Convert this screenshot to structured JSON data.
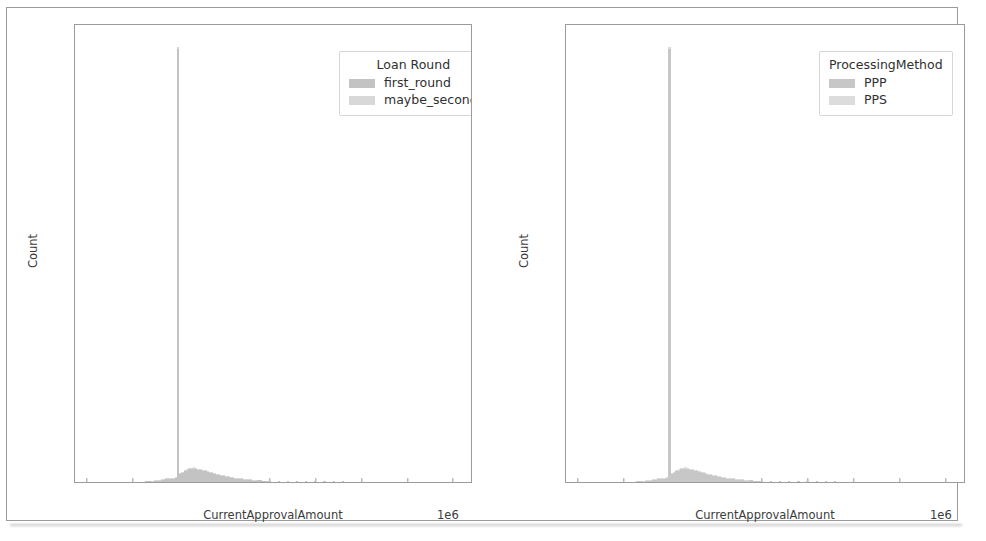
{
  "figure": {
    "background": "#ffffff",
    "frame_color": "#9a9a9a"
  },
  "chart_data": [
    {
      "type": "bar",
      "title": "",
      "subtitle": "",
      "xlabel": "CurrentApprovalAmount",
      "ylabel": "Count",
      "x_offset_text": "1e6",
      "xlim": [
        -250000,
        8400000
      ],
      "ylim": [
        0,
        1530
      ],
      "xticks": [
        0,
        1,
        2,
        3,
        4,
        5,
        6,
        7,
        8
      ],
      "xtick_labels": [
        "0",
        "1",
        "2",
        "3",
        "4",
        "5",
        "6",
        "7",
        "8"
      ],
      "yticks": [
        0,
        200,
        400,
        600,
        800,
        1000,
        1200,
        1400
      ],
      "ytick_labels": [
        "0",
        "200",
        "400",
        "600",
        "800",
        "1000",
        "1200",
        "1400"
      ],
      "grid": false,
      "legend": {
        "title": "Loan Round",
        "position": "upper right",
        "entries": [
          {
            "name": "first_round",
            "color": "#c3c3c3"
          },
          {
            "name": "maybe_second",
            "color": "#d8d8d8"
          }
        ]
      },
      "note": "Stacked histogram of CurrentApprovalAmount (USD, x1e6). Dominant single-bin spike at 2e6.",
      "bin_width_m": 0.05,
      "series": [
        {
          "name": "first_round",
          "color": "#c3c3c3",
          "bins_m": [
            1.3,
            1.35,
            1.4,
            1.45,
            1.5,
            1.55,
            1.6,
            1.65,
            1.7,
            1.75,
            1.8,
            1.85,
            1.9,
            1.95,
            2.0,
            2.05,
            2.1,
            2.15,
            2.2,
            2.25,
            2.3,
            2.35,
            2.4,
            2.45,
            2.5,
            2.55,
            2.6,
            2.65,
            2.7,
            2.75,
            2.8,
            2.85,
            2.9,
            2.95,
            3.0,
            3.05,
            3.1,
            3.15,
            3.2,
            3.25,
            3.3,
            3.35,
            3.4,
            3.45,
            3.5,
            3.55,
            3.6,
            3.65,
            3.7,
            3.75,
            3.8,
            3.85,
            3.9,
            3.95,
            4.0,
            4.2,
            4.4,
            4.6,
            4.8,
            5.0,
            5.2,
            5.4,
            5.6,
            5.8,
            6.0,
            6.4,
            6.8,
            7.2,
            7.6,
            8.0
          ],
          "values": [
            2,
            3,
            3,
            4,
            5,
            6,
            7,
            8,
            9,
            10,
            11,
            12,
            13,
            14,
            1450,
            28,
            32,
            36,
            38,
            42,
            44,
            45,
            43,
            41,
            40,
            38,
            36,
            34,
            32,
            30,
            28,
            26,
            24,
            22,
            21,
            19,
            18,
            16,
            15,
            14,
            13,
            12,
            11,
            10,
            9,
            9,
            8,
            7,
            7,
            6,
            6,
            5,
            5,
            4,
            4,
            4,
            3,
            3,
            3,
            2,
            2,
            2,
            2,
            1,
            1,
            1,
            1,
            1,
            1,
            1
          ]
        },
        {
          "name": "maybe_second",
          "color": "#d8d8d8",
          "bins_m": [
            1.3,
            1.35,
            1.4,
            1.45,
            1.5,
            1.55,
            1.6,
            1.65,
            1.7,
            1.75,
            1.8,
            1.85,
            1.9,
            1.95,
            2.0,
            2.05,
            2.1,
            2.15,
            2.2,
            2.25,
            2.3,
            2.35,
            2.4,
            2.45,
            2.5,
            2.55,
            2.6,
            2.65,
            2.7,
            2.75,
            2.8,
            2.85,
            2.9,
            2.95,
            3.0,
            3.05,
            3.1,
            3.15,
            3.2,
            3.25,
            3.3,
            3.35,
            3.4,
            3.45,
            3.5,
            3.55,
            3.6,
            3.65,
            3.7,
            3.75,
            3.8,
            3.85,
            3.9,
            3.95,
            4.0,
            4.2,
            4.4,
            4.6,
            4.8,
            5.0,
            5.2,
            5.4,
            5.6,
            5.8,
            6.0,
            6.4,
            6.8,
            7.2,
            7.6,
            8.0
          ],
          "values": [
            0,
            0,
            0,
            1,
            1,
            1,
            1,
            1,
            2,
            2,
            2,
            2,
            2,
            3,
            5,
            3,
            3,
            4,
            4,
            4,
            4,
            4,
            4,
            3,
            3,
            3,
            3,
            3,
            2,
            2,
            2,
            2,
            2,
            2,
            2,
            1,
            1,
            1,
            1,
            1,
            1,
            1,
            1,
            1,
            1,
            1,
            1,
            1,
            1,
            0,
            0,
            0,
            0,
            0,
            0,
            0,
            0,
            0,
            0,
            0,
            0,
            0,
            0,
            0,
            0,
            0,
            0,
            0,
            0,
            0
          ]
        }
      ]
    },
    {
      "type": "bar",
      "title": "",
      "subtitle": "",
      "xlabel": "CurrentApprovalAmount",
      "ylabel": "Count",
      "x_offset_text": "1e6",
      "xlim": [
        -250000,
        8400000
      ],
      "ylim": [
        0,
        1530
      ],
      "xticks": [
        0,
        1,
        2,
        3,
        4,
        5,
        6,
        7,
        8
      ],
      "xtick_labels": [
        "0",
        "1",
        "2",
        "3",
        "4",
        "5",
        "6",
        "7",
        "8"
      ],
      "yticks": [
        0,
        200,
        400,
        600,
        800,
        1000,
        1200,
        1400
      ],
      "ytick_labels": [
        "0",
        "200",
        "400",
        "600",
        "800",
        "1000",
        "1200",
        "1400"
      ],
      "grid": false,
      "legend": {
        "title": "ProcessingMethod",
        "position": "upper right",
        "entries": [
          {
            "name": "PPP",
            "color": "#c7c7c7"
          },
          {
            "name": "PPS",
            "color": "#dcdcdc"
          }
        ]
      },
      "note": "Stacked histogram of CurrentApprovalAmount (USD, x1e6). Dominant single-bin spike at 2e6.",
      "bin_width_m": 0.05,
      "series": [
        {
          "name": "PPP",
          "color": "#c7c7c7",
          "bins_m": [
            1.3,
            1.35,
            1.4,
            1.45,
            1.5,
            1.55,
            1.6,
            1.65,
            1.7,
            1.75,
            1.8,
            1.85,
            1.9,
            1.95,
            2.0,
            2.05,
            2.1,
            2.15,
            2.2,
            2.25,
            2.3,
            2.35,
            2.4,
            2.45,
            2.5,
            2.55,
            2.6,
            2.65,
            2.7,
            2.75,
            2.8,
            2.85,
            2.9,
            2.95,
            3.0,
            3.05,
            3.1,
            3.15,
            3.2,
            3.25,
            3.3,
            3.35,
            3.4,
            3.45,
            3.5,
            3.55,
            3.6,
            3.65,
            3.7,
            3.75,
            3.8,
            3.85,
            3.9,
            3.95,
            4.0,
            4.2,
            4.4,
            4.6,
            4.8,
            5.0,
            5.2,
            5.4,
            5.6,
            5.8,
            6.0,
            6.4,
            6.8,
            7.2,
            7.6,
            8.0
          ],
          "values": [
            2,
            3,
            3,
            4,
            5,
            6,
            7,
            8,
            9,
            10,
            11,
            12,
            13,
            14,
            1450,
            28,
            32,
            36,
            38,
            42,
            44,
            45,
            43,
            41,
            40,
            38,
            36,
            34,
            32,
            30,
            28,
            26,
            24,
            22,
            21,
            19,
            18,
            16,
            15,
            14,
            13,
            12,
            11,
            10,
            9,
            9,
            8,
            7,
            7,
            6,
            6,
            5,
            5,
            4,
            4,
            4,
            3,
            3,
            3,
            2,
            2,
            2,
            2,
            1,
            1,
            1,
            1,
            1,
            1,
            1
          ]
        },
        {
          "name": "PPS",
          "color": "#dcdcdc",
          "bins_m": [
            1.3,
            1.35,
            1.4,
            1.45,
            1.5,
            1.55,
            1.6,
            1.65,
            1.7,
            1.75,
            1.8,
            1.85,
            1.9,
            1.95,
            2.0,
            2.05,
            2.1,
            2.15,
            2.2,
            2.25,
            2.3,
            2.35,
            2.4,
            2.45,
            2.5,
            2.55,
            2.6,
            2.65,
            2.7,
            2.75,
            2.8,
            2.85,
            2.9,
            2.95,
            3.0,
            3.05,
            3.1,
            3.15,
            3.2,
            3.25,
            3.3,
            3.35,
            3.4,
            3.45,
            3.5,
            3.55,
            3.6,
            3.65,
            3.7,
            3.75,
            3.8,
            3.85,
            3.9,
            3.95,
            4.0,
            4.2,
            4.4,
            4.6,
            4.8,
            5.0,
            5.2,
            5.4,
            5.6,
            5.8,
            6.0,
            6.4,
            6.8,
            7.2,
            7.6,
            8.0
          ],
          "values": [
            0,
            0,
            0,
            1,
            1,
            1,
            1,
            1,
            2,
            2,
            2,
            2,
            2,
            3,
            5,
            3,
            3,
            4,
            4,
            4,
            4,
            4,
            4,
            3,
            3,
            3,
            3,
            3,
            2,
            2,
            2,
            2,
            2,
            2,
            2,
            1,
            1,
            1,
            1,
            1,
            1,
            1,
            1,
            1,
            1,
            1,
            1,
            1,
            1,
            0,
            0,
            0,
            0,
            0,
            0,
            0,
            0,
            0,
            0,
            0,
            0,
            0,
            0,
            0,
            0,
            0,
            0,
            0,
            0,
            0
          ]
        }
      ]
    }
  ]
}
